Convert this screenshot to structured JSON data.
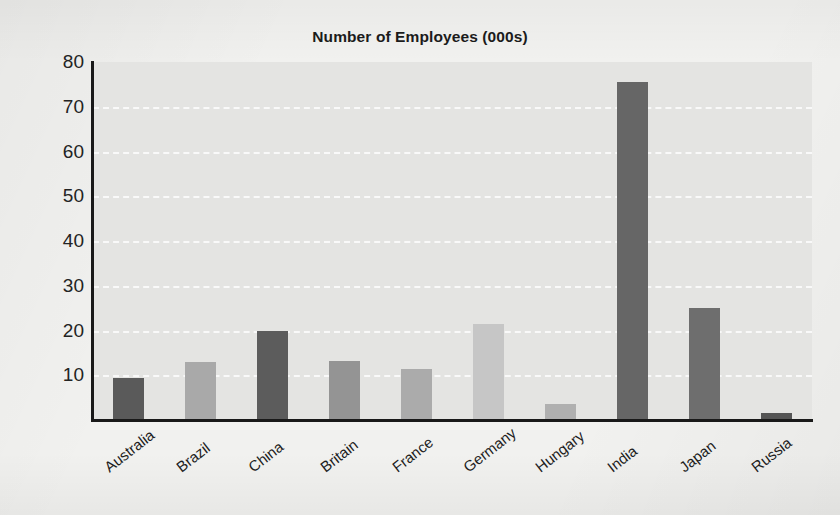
{
  "chart_data": {
    "type": "bar",
    "title": "Number of Employees (000s)",
    "xlabel": "",
    "ylabel": "",
    "categories": [
      "Australia",
      "Brazil",
      "China",
      "Britain",
      "France",
      "Germany",
      "Hungary",
      "India",
      "Japan",
      "Russia"
    ],
    "values": [
      9.5,
      13,
      20,
      13.2,
      11.5,
      21.5,
      3.5,
      75.5,
      25,
      1.5
    ],
    "bar_colors": [
      "#5a5a5a",
      "#a9a9a9",
      "#5c5c5c",
      "#949494",
      "#ababab",
      "#c6c6c6",
      "#b0b0b0",
      "#666666",
      "#6e6e6e",
      "#555555"
    ],
    "ylim": [
      0,
      80
    ],
    "ytick_labels": [
      "80",
      "70",
      "60",
      "50",
      "40",
      "30",
      "20",
      "10"
    ],
    "ytick_values": [
      80,
      70,
      60,
      50,
      40,
      30,
      20,
      10
    ],
    "grid": true,
    "grid_color": "#fbfbfb",
    "grid_style": "dashed",
    "legend": "none",
    "plot_background": "#e4e4e2",
    "axis_color": "#191919",
    "page_background": "#f1f1ef",
    "xtick_rotation_deg": -38
  }
}
